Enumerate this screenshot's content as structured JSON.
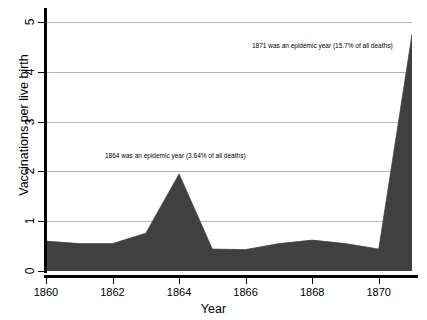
{
  "chart_data": {
    "type": "area",
    "title": "",
    "subtitle": "",
    "xlabel": "Year",
    "ylabel": "Vaccinations per live birth",
    "xlim": [
      1860,
      1871
    ],
    "ylim": [
      0,
      5
    ],
    "grid": true,
    "legend": null,
    "fill_color": "#404040",
    "line_color": "#404040",
    "grid_color": "#b5b5b5",
    "axis_color": "#000000",
    "x": [
      1860,
      1861,
      1862,
      1863,
      1864,
      1865,
      1866,
      1867,
      1868,
      1869,
      1870,
      1871
    ],
    "values": [
      0.6,
      0.55,
      0.55,
      0.76,
      1.95,
      0.44,
      0.43,
      0.55,
      0.62,
      0.55,
      0.44,
      4.75
    ],
    "series": [
      {
        "name": "Vaccinations per live birth",
        "values": [
          0.6,
          0.55,
          0.55,
          0.76,
          1.95,
          0.44,
          0.43,
          0.55,
          0.62,
          0.55,
          0.44,
          4.75
        ]
      }
    ],
    "xticks": [
      1860,
      1862,
      1864,
      1866,
      1868,
      1870
    ],
    "xticklabels": [
      "1860",
      "1862",
      "1864",
      "1866",
      "1868",
      "1870"
    ],
    "yticks": [
      0,
      1,
      2,
      3,
      4,
      5
    ],
    "yticklabels": [
      "0",
      "1",
      "2",
      "3",
      "4",
      "5"
    ],
    "annotations": [
      {
        "id": "epidemic-1864",
        "text": "1864 was an epidemic year (3.64% of all deaths)",
        "x": 1864,
        "y": 2.4
      },
      {
        "id": "epidemic-1871",
        "text": "1871 was an epidemic year (15.7% of all deaths)",
        "x": 1871,
        "y": 4.6
      }
    ]
  }
}
